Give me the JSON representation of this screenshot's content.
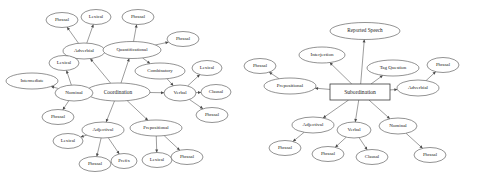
{
  "page": {
    "background_color": "#ffffff",
    "node_outline_color": "#4a4a4a",
    "edge_color": "#5a5a5a",
    "text_color": "#1a1a1a",
    "width": 479,
    "height": 182
  },
  "chart_data": {
    "type": "diagram",
    "diagram_kind": "node-link concept map",
    "title": "",
    "graphs": [
      {
        "id": "coordination-graph",
        "root": "Coordination",
        "root_shape": "ellipse",
        "nodes": [
          {
            "id": "co-root",
            "label": "Coordination",
            "shape": "ellipse",
            "cx": 118,
            "cy": 92,
            "rx": 32,
            "ry": 9,
            "font_size": 5.4
          },
          {
            "id": "co-adverbial",
            "label": "Adverbial",
            "shape": "ellipse",
            "cx": 84,
            "cy": 51,
            "rx": 21,
            "ry": 8,
            "font_size": 5.0
          },
          {
            "id": "co-adverbial-phrasal",
            "label": "Phrasal",
            "shape": "ellipse",
            "cx": 62,
            "cy": 20,
            "rx": 16,
            "ry": 7.5,
            "font_size": 4.8
          },
          {
            "id": "co-adverbial-lexical",
            "label": "Lexical",
            "shape": "ellipse",
            "cx": 96,
            "cy": 17,
            "rx": 15,
            "ry": 7.5,
            "font_size": 4.8
          },
          {
            "id": "co-quantificational",
            "label": "Quantificational",
            "shape": "ellipse",
            "cx": 132,
            "cy": 50,
            "rx": 29,
            "ry": 8.5,
            "font_size": 4.8
          },
          {
            "id": "co-quant-phrasal",
            "label": "Phrasal",
            "shape": "ellipse",
            "cx": 138,
            "cy": 17,
            "rx": 16,
            "ry": 7.5,
            "font_size": 4.8
          },
          {
            "id": "co-combinatory",
            "label": "Combinatory",
            "shape": "ellipse",
            "cx": 160,
            "cy": 71,
            "rx": 25,
            "ry": 8,
            "font_size": 4.8
          },
          {
            "id": "co-verbal",
            "label": "Verbal",
            "shape": "ellipse",
            "cx": 180,
            "cy": 93,
            "rx": 16,
            "ry": 8,
            "font_size": 5.0
          },
          {
            "id": "co-verbal-lexical",
            "label": "Lexical",
            "shape": "ellipse",
            "cx": 207,
            "cy": 68,
            "rx": 15,
            "ry": 7.5,
            "font_size": 4.8
          },
          {
            "id": "co-verbal-clausal",
            "label": "Clausal",
            "shape": "ellipse",
            "cx": 216,
            "cy": 92,
            "rx": 15,
            "ry": 7.5,
            "font_size": 4.8
          },
          {
            "id": "co-verbal-phrasal",
            "label": "Phrasal",
            "shape": "ellipse",
            "cx": 212,
            "cy": 115,
            "rx": 16,
            "ry": 7.5,
            "font_size": 4.8
          },
          {
            "id": "co-combinatory-phrasal",
            "label": "Phrasal",
            "shape": "ellipse",
            "cx": 183,
            "cy": 39,
            "rx": 16,
            "ry": 7.5,
            "font_size": 4.8
          },
          {
            "id": "co-nominal",
            "label": "Nominal",
            "shape": "ellipse",
            "cx": 74,
            "cy": 93,
            "rx": 19,
            "ry": 8,
            "font_size": 5.0
          },
          {
            "id": "co-nominal-lexical",
            "label": "Lexical",
            "shape": "ellipse",
            "cx": 64,
            "cy": 63,
            "rx": 15,
            "ry": 7.5,
            "font_size": 4.8
          },
          {
            "id": "co-nominal-intermediate",
            "label": "Intermediate",
            "shape": "ellipse",
            "cx": 32,
            "cy": 81,
            "rx": 26,
            "ry": 8,
            "font_size": 4.6
          },
          {
            "id": "co-nominal-phrasal",
            "label": "Phrasal",
            "shape": "ellipse",
            "cx": 58,
            "cy": 117,
            "rx": 16,
            "ry": 7.5,
            "font_size": 4.8
          },
          {
            "id": "co-adjectival",
            "label": "Adjectival",
            "shape": "ellipse",
            "cx": 103,
            "cy": 130,
            "rx": 21,
            "ry": 8,
            "font_size": 5.0
          },
          {
            "id": "co-adjectival-lexical",
            "label": "Lexical",
            "shape": "ellipse",
            "cx": 68,
            "cy": 141,
            "rx": 15,
            "ry": 7.5,
            "font_size": 4.8
          },
          {
            "id": "co-adjectival-phrasal",
            "label": "Phrasal",
            "shape": "ellipse",
            "cx": 95,
            "cy": 164,
            "rx": 16,
            "ry": 7.5,
            "font_size": 4.8
          },
          {
            "id": "co-adjectival-prefix",
            "label": "Prefix",
            "shape": "ellipse",
            "cx": 124,
            "cy": 161,
            "rx": 13,
            "ry": 7.5,
            "font_size": 4.8
          },
          {
            "id": "co-prepositional",
            "label": "Prepositional",
            "shape": "ellipse",
            "cx": 156,
            "cy": 128,
            "rx": 26,
            "ry": 8,
            "font_size": 4.8
          },
          {
            "id": "co-prepositional-lexical",
            "label": "Lexical",
            "shape": "ellipse",
            "cx": 157,
            "cy": 160,
            "rx": 15,
            "ry": 7.5,
            "font_size": 4.8
          },
          {
            "id": "co-prepositional-phrasal",
            "label": "Phrasal",
            "shape": "ellipse",
            "cx": 187,
            "cy": 157,
            "rx": 16,
            "ry": 7.5,
            "font_size": 4.8
          }
        ],
        "edges": [
          {
            "from": "co-root",
            "to": "co-adverbial"
          },
          {
            "from": "co-adverbial",
            "to": "co-adverbial-phrasal"
          },
          {
            "from": "co-adverbial",
            "to": "co-adverbial-lexical"
          },
          {
            "from": "co-root",
            "to": "co-quantificational"
          },
          {
            "from": "co-quantificational",
            "to": "co-quant-phrasal"
          },
          {
            "from": "co-quantificational",
            "to": "co-combinatory"
          },
          {
            "from": "co-quantificational",
            "to": "co-combinatory-phrasal"
          },
          {
            "from": "co-combinatory",
            "to": "co-verbal"
          },
          {
            "from": "co-root",
            "to": "co-verbal"
          },
          {
            "from": "co-verbal",
            "to": "co-verbal-lexical"
          },
          {
            "from": "co-verbal",
            "to": "co-verbal-clausal"
          },
          {
            "from": "co-verbal",
            "to": "co-verbal-phrasal"
          },
          {
            "from": "co-root",
            "to": "co-nominal"
          },
          {
            "from": "co-nominal",
            "to": "co-nominal-lexical"
          },
          {
            "from": "co-nominal",
            "to": "co-nominal-intermediate"
          },
          {
            "from": "co-nominal",
            "to": "co-nominal-phrasal"
          },
          {
            "from": "co-root",
            "to": "co-adjectival"
          },
          {
            "from": "co-adjectival",
            "to": "co-adjectival-lexical"
          },
          {
            "from": "co-adjectival",
            "to": "co-adjectival-phrasal"
          },
          {
            "from": "co-adjectival",
            "to": "co-adjectival-prefix"
          },
          {
            "from": "co-root",
            "to": "co-prepositional"
          },
          {
            "from": "co-prepositional",
            "to": "co-prepositional-lexical"
          },
          {
            "from": "co-prepositional",
            "to": "co-prepositional-phrasal"
          }
        ]
      },
      {
        "id": "subordination-graph",
        "root": "Subordination",
        "root_shape": "rectangle",
        "nodes": [
          {
            "id": "su-root",
            "label": "Subordination",
            "shape": "rect",
            "cx": 360,
            "cy": 92,
            "rx": 30,
            "ry": 8,
            "font_size": 5.6
          },
          {
            "id": "su-reported-speech",
            "label": "Reported Speech",
            "shape": "ellipse",
            "cx": 365,
            "cy": 31,
            "rx": 35,
            "ry": 8.5,
            "font_size": 5.2
          },
          {
            "id": "su-interjection",
            "label": "Interjection",
            "shape": "ellipse",
            "cx": 322,
            "cy": 55,
            "rx": 23,
            "ry": 8,
            "font_size": 5.0
          },
          {
            "id": "su-tag-question",
            "label": "Tag Question",
            "shape": "ellipse",
            "cx": 393,
            "cy": 68,
            "rx": 26,
            "ry": 8,
            "font_size": 5.0
          },
          {
            "id": "su-adverbial",
            "label": "Adverbial",
            "shape": "ellipse",
            "cx": 418,
            "cy": 88,
            "rx": 21,
            "ry": 8,
            "font_size": 5.0
          },
          {
            "id": "su-adverbial-phrasal",
            "label": "Phrasal",
            "shape": "ellipse",
            "cx": 443,
            "cy": 65,
            "rx": 16,
            "ry": 7.5,
            "font_size": 4.8
          },
          {
            "id": "su-prepositional",
            "label": "Prepositional",
            "shape": "ellipse",
            "cx": 290,
            "cy": 86,
            "rx": 26,
            "ry": 8,
            "font_size": 5.0
          },
          {
            "id": "su-prepositional-phrasal",
            "label": "Phrasal",
            "shape": "ellipse",
            "cx": 260,
            "cy": 66,
            "rx": 16,
            "ry": 7.5,
            "font_size": 4.8
          },
          {
            "id": "su-adjectival",
            "label": "Adjectival",
            "shape": "ellipse",
            "cx": 313,
            "cy": 125,
            "rx": 21,
            "ry": 8,
            "font_size": 5.0
          },
          {
            "id": "su-adjectival-phrasal",
            "label": "Phrasal",
            "shape": "ellipse",
            "cx": 285,
            "cy": 148,
            "rx": 16,
            "ry": 7.5,
            "font_size": 4.8
          },
          {
            "id": "su-verbal",
            "label": "Verbal",
            "shape": "ellipse",
            "cx": 354,
            "cy": 130,
            "rx": 17,
            "ry": 8,
            "font_size": 5.0
          },
          {
            "id": "su-verbal-phrasal",
            "label": "Phrasal",
            "shape": "ellipse",
            "cx": 328,
            "cy": 154,
            "rx": 16,
            "ry": 7.5,
            "font_size": 4.8
          },
          {
            "id": "su-verbal-clausal",
            "label": "Clausal",
            "shape": "ellipse",
            "cx": 372,
            "cy": 157,
            "rx": 16,
            "ry": 7.5,
            "font_size": 4.8
          },
          {
            "id": "su-nominal",
            "label": "Nominal",
            "shape": "ellipse",
            "cx": 398,
            "cy": 126,
            "rx": 19,
            "ry": 8,
            "font_size": 5.0
          },
          {
            "id": "su-nominal-phrasal",
            "label": "Phrasal",
            "shape": "ellipse",
            "cx": 430,
            "cy": 155,
            "rx": 16,
            "ry": 7.5,
            "font_size": 4.8
          }
        ],
        "edges": [
          {
            "from": "su-root",
            "to": "su-reported-speech"
          },
          {
            "from": "su-root",
            "to": "su-interjection"
          },
          {
            "from": "su-root",
            "to": "su-tag-question"
          },
          {
            "from": "su-root",
            "to": "su-adverbial"
          },
          {
            "from": "su-adverbial",
            "to": "su-adverbial-phrasal"
          },
          {
            "from": "su-root",
            "to": "su-prepositional"
          },
          {
            "from": "su-prepositional",
            "to": "su-prepositional-phrasal"
          },
          {
            "from": "su-root",
            "to": "su-adjectival"
          },
          {
            "from": "su-adjectival",
            "to": "su-adjectival-phrasal"
          },
          {
            "from": "su-root",
            "to": "su-verbal"
          },
          {
            "from": "su-verbal",
            "to": "su-verbal-phrasal"
          },
          {
            "from": "su-verbal",
            "to": "su-verbal-clausal"
          },
          {
            "from": "su-root",
            "to": "su-nominal"
          },
          {
            "from": "su-nominal",
            "to": "su-nominal-phrasal"
          }
        ]
      }
    ]
  }
}
